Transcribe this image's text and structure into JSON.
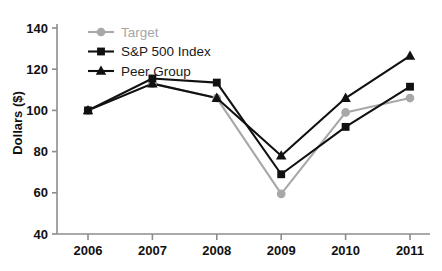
{
  "chart_data": {
    "type": "line",
    "title": "",
    "xlabel": "",
    "ylabel": "Dollars ($)",
    "categories": [
      "2006",
      "2007",
      "2008",
      "2009",
      "2010",
      "2011"
    ],
    "x": [
      2006,
      2007,
      2008,
      2009,
      2010,
      2011
    ],
    "ylim": [
      40,
      140
    ],
    "yticks": [
      40,
      60,
      80,
      100,
      120,
      140
    ],
    "ytick_labels": [
      "40",
      "60",
      "80",
      "100",
      "120",
      "140"
    ],
    "grid": false,
    "legend_position": "top-left",
    "series": [
      {
        "name": "Target",
        "marker": "circle",
        "color": "#a8a8a8",
        "values": [
          100,
          113,
          106,
          59.5,
          99,
          106
        ]
      },
      {
        "name": "S&P 500 Index",
        "marker": "square",
        "color": "#111111",
        "values": [
          100,
          115.5,
          113.5,
          69,
          92,
          111.5
        ]
      },
      {
        "name": "Peer Group",
        "marker": "triangle",
        "color": "#111111",
        "values": [
          100,
          113,
          106,
          78,
          106,
          126.5
        ]
      }
    ]
  },
  "axis": {
    "y_title": "Dollars ($)",
    "line_color": "#8c8c8c"
  },
  "legend": {
    "items": [
      {
        "label": "Target",
        "color": "#a8a8a8",
        "marker": "circle"
      },
      {
        "label": "S&P 500 Index",
        "color": "#111111",
        "marker": "square"
      },
      {
        "label": "Peer Group",
        "color": "#111111",
        "marker": "triangle"
      }
    ]
  }
}
